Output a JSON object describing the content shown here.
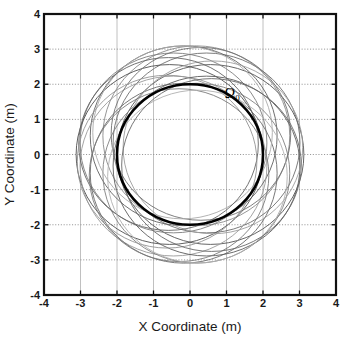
{
  "chart_data": {
    "type": "line",
    "title": "",
    "xlabel": "X Coordinate (m)",
    "ylabel": "Y Coordinate (m)",
    "xlim": [
      -4,
      4
    ],
    "ylim": [
      -4,
      4
    ],
    "xticks": [
      "-4",
      "-3",
      "-2",
      "-1",
      "0",
      "1",
      "2",
      "3",
      "4"
    ],
    "yticks": [
      "4",
      "3",
      "2",
      "1",
      "0",
      "-1",
      "-2",
      "-3",
      "-4"
    ],
    "xtick_values": [
      -4,
      -3,
      -2,
      -1,
      0,
      1,
      2,
      3,
      4
    ],
    "ytick_values": [
      4,
      3,
      2,
      1,
      0,
      -1,
      -2,
      -3,
      -4
    ],
    "grid": true,
    "grid_style": "vertical solid light-gray, horizontal dotted gray",
    "legend": "none",
    "aspect": "equal",
    "annotations": [
      {
        "text": "Ω",
        "subscript": "0",
        "x": 0.95,
        "y": 1.62,
        "name": "omega-zero-label"
      }
    ],
    "series": [
      {
        "name": "Omega_0 reference circle",
        "kind": "circle",
        "center": [
          0,
          0
        ],
        "radius": 2.0,
        "color": "#000000",
        "linewidth": 2.6,
        "emphasis": "bold"
      },
      {
        "name": "epicyclic orbit family",
        "kind": "circle-family",
        "count": 10,
        "radius": 2.56,
        "center_orbit_radius": 0.56,
        "center_angles_deg": [
          0,
          36,
          72,
          108,
          144,
          180,
          216,
          252,
          288,
          324
        ],
        "outer_envelope_radius": 3.12,
        "inner_envelope_radius": 2.0,
        "colors": [
          "#555555",
          "#6e6e6e",
          "#8a8a8a",
          "#606060",
          "#7d7d7d",
          "#4f4f4f",
          "#9a9a9a",
          "#6a6a6a",
          "#808080",
          "#5c5c5c"
        ],
        "linewidth": 0.9
      },
      {
        "name": "secondary orbit family",
        "kind": "circle-family",
        "count": 8,
        "radius": 2.46,
        "center_orbit_radius": 0.66,
        "center_angles_deg": [
          18,
          63,
          108,
          153,
          198,
          243,
          288,
          333
        ],
        "colors": [
          "#9d9d9d",
          "#707070",
          "#aaaaaa",
          "#636363",
          "#949494",
          "#7a7a7a",
          "#b0b0b0",
          "#686868"
        ],
        "linewidth": 0.9
      }
    ],
    "colors": {
      "axis": "#111111",
      "grid_vertical": "#b9b9b9",
      "grid_horizontal": "#8d8d8d",
      "background": "#ffffff",
      "emphasis_curve": "#000000"
    }
  },
  "axes": {
    "x_label": "X Coordinate (m)",
    "y_label": "Y Coordinate (m)"
  }
}
